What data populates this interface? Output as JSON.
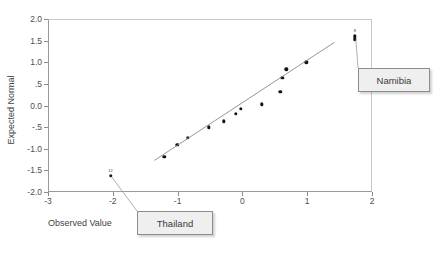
{
  "chart_data": {
    "type": "scatter",
    "title": "",
    "xlabel": "Observed Value",
    "ylabel": "Expected Normal",
    "xlim": [
      -3,
      2
    ],
    "ylim": [
      -2.0,
      2.0
    ],
    "xticks": [
      "-3",
      "-2",
      "-1",
      "0",
      "1",
      "2"
    ],
    "xtick_values": [
      -3,
      -2,
      -1,
      0,
      1,
      2
    ],
    "yticks": [
      "2.0",
      "1.5",
      "1.0",
      ".5",
      "0.0",
      "-.5",
      "-1.0",
      "-1.5",
      "-2.0"
    ],
    "ytick_values": [
      2.0,
      1.5,
      1.0,
      0.5,
      0.0,
      -0.5,
      -1.0,
      -1.5,
      -2.0
    ],
    "grid": false,
    "legend": "none",
    "points": [
      {
        "x": -2.05,
        "y": -1.6,
        "label": "12"
      },
      {
        "x": -1.22,
        "y": -1.17,
        "label": ""
      },
      {
        "x": -1.02,
        "y": -0.88,
        "label": ""
      },
      {
        "x": -0.86,
        "y": -0.72,
        "label": ""
      },
      {
        "x": -0.53,
        "y": -0.48,
        "label": ""
      },
      {
        "x": -0.3,
        "y": -0.34,
        "label": ""
      },
      {
        "x": -0.12,
        "y": -0.17,
        "label": ""
      },
      {
        "x": -0.04,
        "y": -0.05,
        "label": ""
      },
      {
        "x": 0.28,
        "y": 0.05,
        "label": ""
      },
      {
        "x": 0.57,
        "y": 0.34,
        "label": ""
      },
      {
        "x": 0.6,
        "y": 0.66,
        "label": ""
      },
      {
        "x": 0.66,
        "y": 0.86,
        "label": ""
      },
      {
        "x": 0.97,
        "y": 1.02,
        "label": ""
      },
      {
        "x": 1.72,
        "y": 1.55,
        "label": ""
      },
      {
        "x": 1.72,
        "y": 1.62,
        "label": "8"
      }
    ],
    "reference_line": {
      "x0": -1.36,
      "y0": -1.27,
      "x1": 1.42,
      "y1": 1.46
    }
  },
  "annotations": {
    "thailand": {
      "label": "Thailand"
    },
    "namibia": {
      "label": "Namibia"
    }
  },
  "colors": {
    "point": "#111111",
    "line": "#8a8a8a",
    "frame": "#9a9a9a",
    "callout_bg": "#efefef",
    "callout_border": "#8c8c8c",
    "text": "#3f3f3f"
  }
}
